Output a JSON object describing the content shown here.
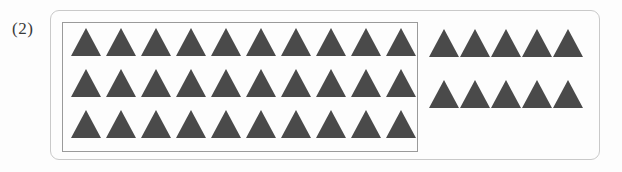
{
  "page": {
    "background_color": "#fdfdfd",
    "width": 622,
    "height": 172
  },
  "problem": {
    "number_label": "(2)"
  },
  "outer_panel": {
    "name": "outer-rounded-panel",
    "border_color": "#c9c9c9",
    "corner_radius_px": 9
  },
  "grouped_box": {
    "name": "inner-group-box",
    "border_color": "#9a9a9a",
    "rows": 3,
    "columns_per_row": 10,
    "total_count": 30,
    "row_counts": [
      10,
      10,
      10
    ]
  },
  "loose_group": {
    "name": "ungrouped-remainder",
    "rows": 2,
    "columns_per_row": 5,
    "total_count": 10,
    "row_counts": [
      5,
      5
    ]
  },
  "shape": {
    "icon_name": "triangle-icon",
    "fill_color": "#4a4a4a",
    "width_px": 30,
    "height_px": 28
  },
  "totals": {
    "grouped": 30,
    "loose": 10,
    "all": 40
  }
}
